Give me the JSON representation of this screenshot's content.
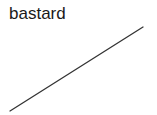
{
  "label": {
    "text": "bastard",
    "color": "#1a1a1a"
  },
  "line": {
    "x1": 10,
    "y1": 111,
    "x2": 143,
    "y2": 27,
    "stroke": "#333333"
  }
}
